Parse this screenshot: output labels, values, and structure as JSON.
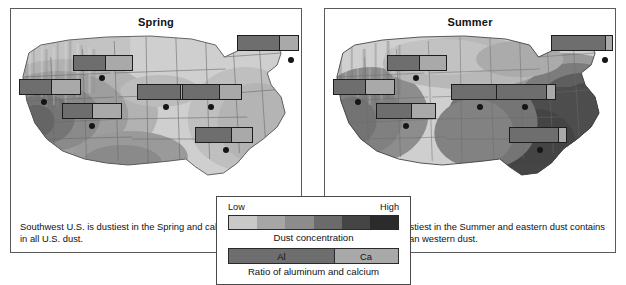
{
  "figure": {
    "type": "map-pair",
    "panels": [
      {
        "id": "spring",
        "title": "Spring",
        "caption": "Southwest U.S. is dustiest in the Spring and calcium is abundant in all U.S. dust.",
        "stations": [
          {
            "name": "pacific-southwest",
            "x": 8,
            "y": 52,
            "width": 62,
            "al_pct": 52,
            "ca_pct": 48,
            "dot_x": 30,
            "dot_y": 72
          },
          {
            "name": "northern-plains",
            "x": 62,
            "y": 28,
            "width": 60,
            "al_pct": 53,
            "ca_pct": 47,
            "dot_x": 88,
            "dot_y": 48
          },
          {
            "name": "desert-southwest",
            "x": 51,
            "y": 76,
            "width": 60,
            "al_pct": 50,
            "ca_pct": 50,
            "dot_x": 78,
            "dot_y": 96
          },
          {
            "name": "central-plains",
            "x": 126,
            "y": 57,
            "width": 60,
            "al_pct": 72,
            "ca_pct": 28,
            "dot_x": 152,
            "dot_y": 77
          },
          {
            "name": "midwest",
            "x": 171,
            "y": 57,
            "width": 60,
            "al_pct": 62,
            "ca_pct": 38,
            "dot_x": 197,
            "dot_y": 77
          },
          {
            "name": "southeast",
            "x": 184,
            "y": 100,
            "width": 58,
            "al_pct": 63,
            "ca_pct": 37,
            "dot_x": 212,
            "dot_y": 120
          },
          {
            "name": "northeast",
            "x": 226,
            "y": 8,
            "width": 62,
            "al_pct": 68,
            "ca_pct": 32,
            "dot_x": 277,
            "dot_y": 30
          }
        ]
      },
      {
        "id": "summer",
        "title": "Summer",
        "caption": "Eastern U.S. is dustiest in the Summer and eastern dust contains more aluminum than western dust.",
        "stations": [
          {
            "name": "pacific-southwest",
            "x": 8,
            "y": 52,
            "width": 62,
            "al_pct": 52,
            "ca_pct": 48,
            "dot_x": 30,
            "dot_y": 72
          },
          {
            "name": "northern-plains",
            "x": 62,
            "y": 28,
            "width": 60,
            "al_pct": 53,
            "ca_pct": 47,
            "dot_x": 88,
            "dot_y": 48
          },
          {
            "name": "desert-southwest",
            "x": 51,
            "y": 76,
            "width": 60,
            "al_pct": 58,
            "ca_pct": 42,
            "dot_x": 78,
            "dot_y": 96
          },
          {
            "name": "central-plains",
            "x": 126,
            "y": 57,
            "width": 60,
            "al_pct": 85,
            "ca_pct": 15,
            "dot_x": 152,
            "dot_y": 77
          },
          {
            "name": "midwest",
            "x": 171,
            "y": 57,
            "width": 60,
            "al_pct": 84,
            "ca_pct": 16,
            "dot_x": 197,
            "dot_y": 77
          },
          {
            "name": "southeast",
            "x": 184,
            "y": 100,
            "width": 58,
            "al_pct": 86,
            "ca_pct": 14,
            "dot_x": 212,
            "dot_y": 120
          },
          {
            "name": "northeast",
            "x": 226,
            "y": 8,
            "width": 62,
            "al_pct": 89,
            "ca_pct": 11,
            "dot_x": 277,
            "dot_y": 30
          }
        ]
      }
    ]
  },
  "legend": {
    "low_label": "Low",
    "high_label": "High",
    "concentration_label": "Dust concentration",
    "ratio_label": "Ratio of aluminum and calcium",
    "al_label": "Al",
    "ca_label": "Ca",
    "al_share_pct": 62,
    "ca_share_pct": 38,
    "gradient_steps": [
      "#c9c9c9",
      "#a6a6a6",
      "#8c8c8c",
      "#6b6b6b",
      "#454545",
      "#2b2b2b"
    ]
  },
  "colors": {
    "al_swatch": "#6e6e6e",
    "ca_swatch": "#a9a9a9",
    "panel_border": "#5a5a5a",
    "legend_border": "#4a4a4a",
    "station_dot": "#151515",
    "bar_border": "#1d1d1d",
    "map_level_1": "#cfcfcf",
    "map_level_2": "#b2b2b2",
    "map_level_3": "#979797",
    "map_level_4": "#7c7c7c",
    "map_level_5": "#5e5e5e",
    "map_level_6": "#3f3f3f",
    "map_outline": "#6a6a6a",
    "background": "#ffffff"
  }
}
